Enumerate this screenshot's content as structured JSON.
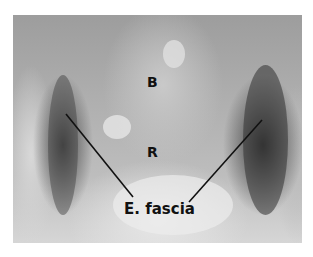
{
  "figure": {
    "labels": {
      "b": "B",
      "r": "R",
      "fascia": "E. fascia"
    }
  }
}
